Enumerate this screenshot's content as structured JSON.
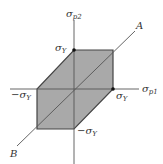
{
  "diagram": {
    "type": "yield-surface-hexagon",
    "colors": {
      "fill": "#a9a9a9",
      "stroke": "#444444",
      "axis": "#555555",
      "text": "#333333"
    },
    "axes": {
      "horizontal": {
        "symbol": "σ",
        "subscript": "p1"
      },
      "vertical": {
        "symbol": "σ",
        "subscript": "p2"
      }
    },
    "diagonal": {
      "upper_label": "A",
      "lower_label": "B"
    },
    "labels": {
      "top": {
        "symbol": "σ",
        "subscript": "Y"
      },
      "right": {
        "symbol": "σ",
        "subscript": "Y"
      },
      "left": {
        "symbol": "−σ",
        "subscript": "Y"
      },
      "bottom": {
        "symbol": "−σ",
        "subscript": "Y"
      }
    }
  }
}
